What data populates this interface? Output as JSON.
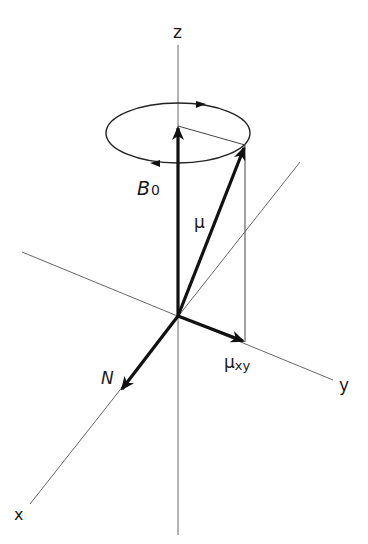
{
  "diagram": {
    "type": "3d-vector-precession",
    "labels": {
      "z_axis": "z",
      "y_axis": "y",
      "x_axis": "x",
      "b0": "B",
      "b0_sub": "0",
      "mu": "μ",
      "mu_xy": "μ",
      "mu_xy_sub": "xy",
      "n": "N"
    },
    "colors": {
      "axis": "#555555",
      "vector": "#111111",
      "text": "#1a1a1a",
      "background": "#ffffff"
    }
  }
}
